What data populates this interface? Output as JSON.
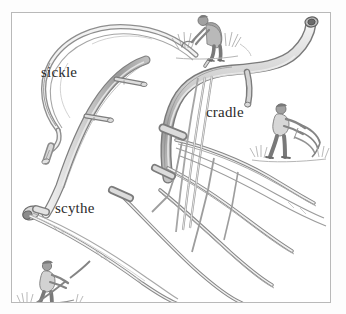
{
  "plate": {
    "kind": "pencil-illustration",
    "subject": "hand harvesting tools",
    "background_color": "#ffffff",
    "border_color": "#b9b9b9",
    "ink_color": "#6f6f6f"
  },
  "labels": {
    "sickle": "sickle",
    "cradle": "cradle",
    "scythe": "scythe"
  },
  "tools": [
    {
      "id": "sickle",
      "label": "sickle",
      "description": "short curved hook blade with a stubby handle"
    },
    {
      "id": "scythe",
      "label": "scythe",
      "description": "long curved snath with two peg nibs and a long sweeping blade"
    },
    {
      "id": "cradle",
      "label": "cradle",
      "description": "scythe fitted with four curved wooden fingers and ladder bracing"
    }
  ],
  "vignettes": [
    {
      "id": "reaper-with-sickle",
      "description": "figure bending over cutting grain with a sickle"
    },
    {
      "id": "cradler-at-work",
      "description": "figure swinging a cradle scythe through standing grain"
    },
    {
      "id": "mower-with-scythe",
      "description": "figure mowing with a long scythe"
    }
  ]
}
